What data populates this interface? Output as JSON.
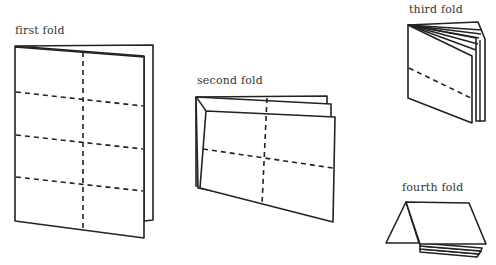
{
  "diagram": {
    "stages": [
      {
        "id": "first",
        "label": "first fold"
      },
      {
        "id": "second",
        "label": "second fold"
      },
      {
        "id": "third",
        "label": "third fold"
      },
      {
        "id": "fourth",
        "label": "fourth fold"
      }
    ],
    "colors": {
      "stroke": "#222222",
      "background": "#ffffff",
      "label": "#333333"
    }
  }
}
